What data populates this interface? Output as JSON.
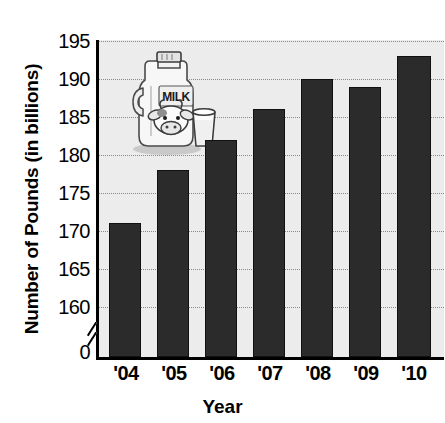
{
  "chart_data": {
    "type": "bar",
    "title": "",
    "xlabel": "Year",
    "ylabel": "Number of Pounds (in billions)",
    "categories": [
      "'04",
      "'05",
      "'06",
      "'07",
      "'08",
      "'09",
      "'10"
    ],
    "values": [
      171,
      178,
      182,
      186,
      190,
      189,
      193
    ],
    "ylim": [
      160,
      195
    ],
    "yticks": [
      195,
      190,
      185,
      180,
      175,
      170,
      165,
      160,
      0
    ],
    "ytick_labels": [
      "195",
      "190",
      "185",
      "180",
      "175",
      "170",
      "165",
      "160",
      "0"
    ],
    "axis_break": true,
    "axis_break_between": [
      160,
      0
    ],
    "grid": true,
    "grid_style": "dotted",
    "legend": null,
    "series": [
      {
        "name": "Number of Pounds (in billions)",
        "values": [
          171,
          178,
          182,
          186,
          190,
          189,
          193
        ]
      }
    ],
    "colors": {
      "bar": "#2b2b2b",
      "bar_border": "#111111",
      "plot_background": "#ececec",
      "gridline": "#8a8a8a",
      "axis": "#000000",
      "page_background": "#ffffff"
    },
    "annotations": [
      {
        "name": "milk-illustration",
        "description": "Milk jug with cow face and a glass of milk",
        "label_text": "MILK"
      }
    ]
  }
}
